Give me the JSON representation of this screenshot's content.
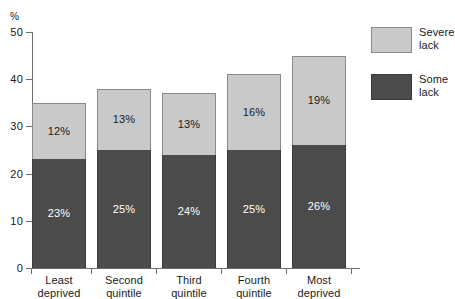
{
  "chart_data": {
    "type": "bar",
    "subtype": "stacked-bar",
    "title": "",
    "xlabel": "",
    "ylabel": "%",
    "ylim": [
      0,
      50
    ],
    "yticks": [
      0,
      10,
      20,
      30,
      40,
      50
    ],
    "ytick_labels": [
      "0",
      "10",
      "20",
      "30",
      "40",
      "50"
    ],
    "grid": false,
    "legend_position": "right",
    "categories": [
      "Least deprived",
      "Second quintile",
      "Third quintile",
      "Fourth quintile",
      "Most deprived"
    ],
    "category_lines": [
      [
        "Least",
        "deprived"
      ],
      [
        "Second",
        "quintile"
      ],
      [
        "Third",
        "quintile"
      ],
      [
        "Fourth",
        "quintile"
      ],
      [
        "Most",
        "deprived"
      ]
    ],
    "series": [
      {
        "name": "Some lack",
        "name_lines": [
          "Some",
          "lack"
        ],
        "color": "#4b4b4b",
        "values": [
          23,
          25,
          24,
          25,
          26
        ],
        "labels": [
          "23%",
          "25%",
          "24%",
          "25%",
          "26%"
        ]
      },
      {
        "name": "Severe lack",
        "name_lines": [
          "Severe",
          "lack"
        ],
        "color": "#c9c9c9",
        "values": [
          12,
          13,
          13,
          16,
          19
        ],
        "labels": [
          "12%",
          "13%",
          "13%",
          "16%",
          "19%"
        ]
      }
    ],
    "totals": [
      35,
      38,
      37,
      41,
      45
    ]
  },
  "axis": {
    "percent_sign": "%"
  },
  "colors": {
    "severe": "#c9c9c9",
    "some": "#4b4b4b",
    "axis": "#6e6e6e",
    "background": "#ffffff"
  }
}
